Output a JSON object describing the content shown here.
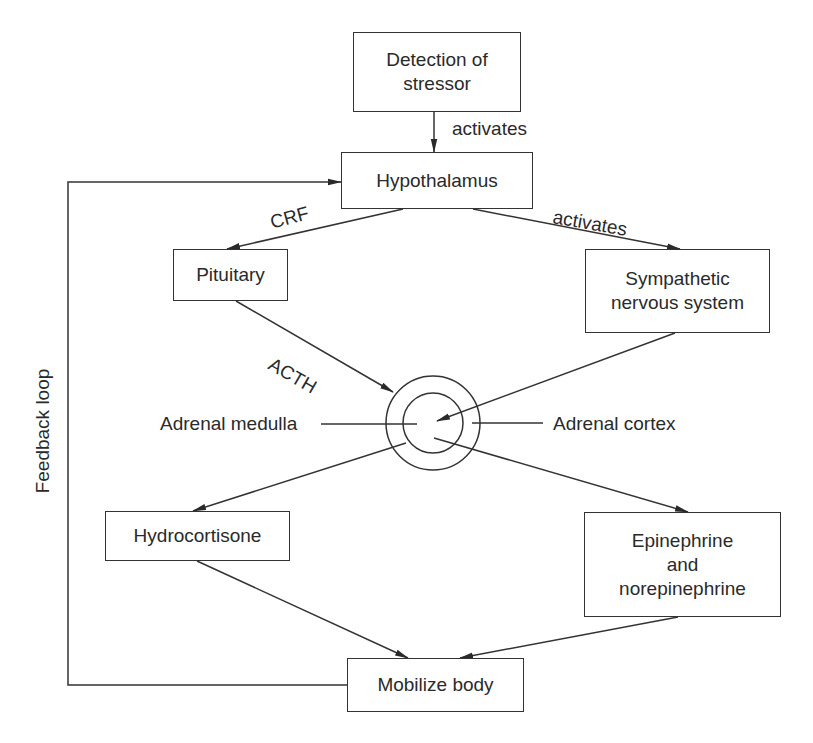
{
  "diagram": {
    "type": "flowchart",
    "title": "",
    "nodes": {
      "detection": {
        "label": "Detection of\nstressor"
      },
      "hypothalamus": {
        "label": "Hypothalamus"
      },
      "pituitary": {
        "label": "Pituitary"
      },
      "sympathetic": {
        "label": "Sympathetic\nnervous system"
      },
      "hydrocortisone": {
        "label": "Hydrocortisone"
      },
      "epinephrine": {
        "label": "Epinephrine\nand\nnorepinephrine"
      },
      "mobilize": {
        "label": "Mobilize body"
      }
    },
    "adrenal_gland": {
      "medulla_label": "Adrenal medulla",
      "cortex_label": "Adrenal cortex"
    },
    "edge_labels": {
      "detection_to_hypothalamus": "activates",
      "hypothalamus_to_pituitary": "CRF",
      "hypothalamus_to_sympathetic": "activates",
      "pituitary_to_adrenal": "ACTH",
      "feedback": "Feedback loop"
    },
    "edges": [
      {
        "from": "Detection of stressor",
        "to": "Hypothalamus",
        "label": "activates"
      },
      {
        "from": "Hypothalamus",
        "to": "Pituitary",
        "label": "CRF"
      },
      {
        "from": "Hypothalamus",
        "to": "Sympathetic nervous system",
        "label": "activates"
      },
      {
        "from": "Pituitary",
        "to": "Adrenal cortex",
        "label": "ACTH"
      },
      {
        "from": "Sympathetic nervous system",
        "to": "Adrenal medulla",
        "label": ""
      },
      {
        "from": "Adrenal cortex",
        "to": "Hydrocortisone",
        "label": ""
      },
      {
        "from": "Adrenal medulla",
        "to": "Epinephrine and norepinephrine",
        "label": ""
      },
      {
        "from": "Hydrocortisone",
        "to": "Mobilize body",
        "label": ""
      },
      {
        "from": "Epinephrine and norepinephrine",
        "to": "Mobilize body",
        "label": ""
      },
      {
        "from": "Mobilize body",
        "to": "Hypothalamus",
        "label": "Feedback loop"
      }
    ],
    "colors": {
      "line": "#333333",
      "text": "#2a2a2a",
      "background": "#ffffff"
    }
  }
}
